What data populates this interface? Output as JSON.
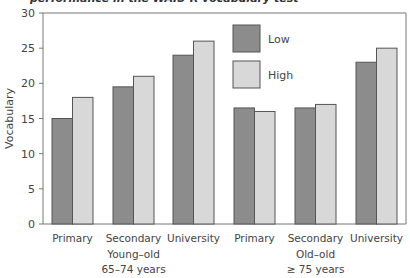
{
  "chart_data": {
    "type": "bar",
    "title": "performance in the WAIS-R vocabulary test",
    "xlabel": "",
    "ylabel": "Vocabulary",
    "ylim": [
      0,
      30
    ],
    "yticks": [
      0,
      5,
      10,
      15,
      20,
      25,
      30
    ],
    "grid": false,
    "legend_position": "top-center-inside",
    "categories": [
      "Primary",
      "Secondary",
      "University",
      "Primary",
      "Secondary",
      "University"
    ],
    "groups": [
      {
        "label_line1": "Young–old",
        "label_line2": "65–74 years",
        "categories": [
          "Primary",
          "Secondary",
          "University"
        ]
      },
      {
        "label_line1": "Old–old",
        "label_line2": "≥ 75 years",
        "categories": [
          "Primary",
          "Secondary",
          "University"
        ]
      }
    ],
    "series": [
      {
        "name": "Low",
        "color": "#8c8c8c",
        "values": [
          15,
          19.5,
          24,
          16.5,
          16.5,
          23
        ]
      },
      {
        "name": "High",
        "color": "#d8d8d8",
        "values": [
          18,
          21,
          26,
          16,
          17,
          25
        ]
      }
    ]
  },
  "colors": {
    "bar_border": "#555555",
    "axis": "#777777",
    "text": "#444444"
  }
}
